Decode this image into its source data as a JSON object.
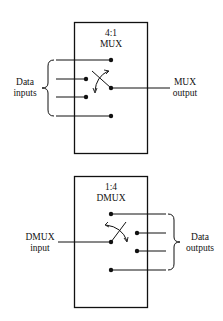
{
  "mux": {
    "title_ratio": "4:1",
    "title_name": "MUX",
    "inputs_label_line1": "Data",
    "inputs_label_line2": "inputs",
    "output_label_line1": "MUX",
    "output_label_line2": "output",
    "input_count": 4
  },
  "dmux": {
    "title_ratio": "1:4",
    "title_name": "DMUX",
    "input_label_line1": "DMUX",
    "input_label_line2": "input",
    "outputs_label_line1": "Data",
    "outputs_label_line2": "outputs",
    "output_count": 4
  },
  "colors": {
    "stroke": "#111111",
    "background": "#ffffff"
  }
}
